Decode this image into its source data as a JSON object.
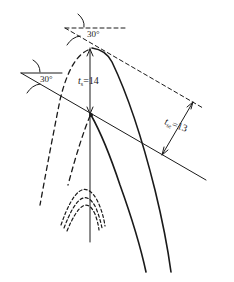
{
  "diagram": {
    "labels": {
      "angle_top": "30°",
      "angle_left": "30°",
      "ts_var": "t",
      "ts_sub": "s",
      "ts_value": "=14",
      "tse_var": "t",
      "tse_sub": "se",
      "tse_value": "=13"
    },
    "colors": {
      "stroke": "#1a1a1a",
      "background": "#ffffff"
    }
  }
}
